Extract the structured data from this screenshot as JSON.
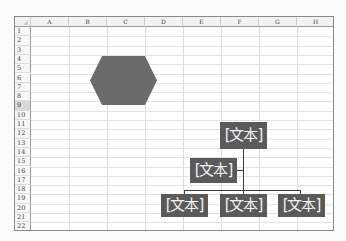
{
  "sheet": {
    "columns": [
      "A",
      "B",
      "C",
      "D",
      "E",
      "F",
      "G",
      "H"
    ],
    "rows": [
      "1",
      "2",
      "3",
      "4",
      "5",
      "6",
      "7",
      "8",
      "9",
      "10",
      "11",
      "12",
      "13",
      "14",
      "15",
      "16",
      "17",
      "18",
      "19",
      "20",
      "21",
      "22"
    ],
    "selected_row": "9"
  },
  "shapes": {
    "hexagon": {
      "type": "hexagon",
      "fill": "#6b6b6b"
    }
  },
  "org_chart": {
    "fill": "#5a5a5a",
    "text_color": "#f2f2f2",
    "top": {
      "label": "[文本]"
    },
    "assistant": {
      "label": "[文本]"
    },
    "children": [
      {
        "label": "[文本]"
      },
      {
        "label": "[文本]"
      },
      {
        "label": "[文本]"
      }
    ]
  }
}
